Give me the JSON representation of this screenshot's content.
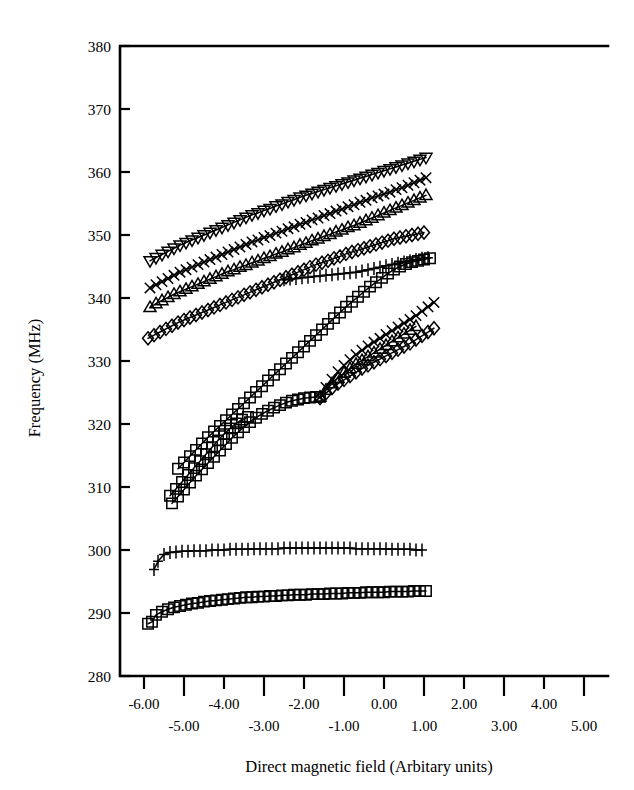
{
  "figure": {
    "width": 634,
    "height": 790,
    "background": "#ffffff",
    "ink_color": "#000000"
  },
  "chart_data": {
    "type": "line",
    "title": "",
    "subtitle": "",
    "xlabel": "Direct magnetic field (Arbitary units)",
    "ylabel": "Frequency (MHz)",
    "xlim": [
      -6.6,
      5.6
    ],
    "ylim": [
      280,
      380
    ],
    "grid": false,
    "legend": "none",
    "frame": "top-and-left-spines-with-bottom-axis",
    "xticks": [
      -6,
      -5,
      -4,
      -3,
      -2,
      -1,
      0,
      1,
      2,
      3,
      4,
      5
    ],
    "xticklabels": [
      "-6.00",
      "-5.00",
      "-4.00",
      "-3.00",
      "-2.00",
      "-1.00",
      "0.00",
      "1.00",
      "2.00",
      "3.00",
      "4.00",
      "5.00"
    ],
    "xticklabel_stagger": [
      "up",
      "down",
      "up",
      "down",
      "up",
      "down",
      "up",
      "down",
      "up",
      "down",
      "up",
      "down"
    ],
    "yticks": [
      280,
      290,
      300,
      310,
      320,
      330,
      340,
      350,
      360,
      370,
      380
    ],
    "yticklabels": [
      "280",
      "290",
      "300",
      "310",
      "320",
      "330",
      "340",
      "350",
      "360",
      "370",
      "380"
    ],
    "marker_size": 5.2,
    "series": [
      {
        "name": "branch-1-down-triangle",
        "marker": "triangle-down",
        "x": [
          -5.85,
          -5.7,
          -5.55,
          -5.4,
          -5.25,
          -5.1,
          -4.95,
          -4.8,
          -4.65,
          -4.5,
          -4.35,
          -4.2,
          -4.05,
          -3.9,
          -3.75,
          -3.6,
          -3.45,
          -3.3,
          -3.15,
          -3.0,
          -2.85,
          -2.7,
          -2.55,
          -2.4,
          -2.25,
          -2.1,
          -1.95,
          -1.8,
          -1.65,
          -1.5,
          -1.35,
          -1.2,
          -1.05,
          -0.9,
          -0.75,
          -0.6,
          -0.45,
          -0.3,
          -0.15,
          0.0,
          0.15,
          0.3,
          0.45,
          0.6,
          0.75,
          0.9,
          1.05
        ],
        "y": [
          345.9,
          346.4,
          346.9,
          347.4,
          347.9,
          348.4,
          348.8,
          349.2,
          349.6,
          350.0,
          350.4,
          350.8,
          351.2,
          351.6,
          352.0,
          352.4,
          352.8,
          353.2,
          353.5,
          353.9,
          354.2,
          354.6,
          354.9,
          355.3,
          355.6,
          356.0,
          356.3,
          356.6,
          356.9,
          357.2,
          357.5,
          357.8,
          358.1,
          358.4,
          358.7,
          359.0,
          359.3,
          359.6,
          359.9,
          360.2,
          360.5,
          360.8,
          361.1,
          361.4,
          361.7,
          362.0,
          362.3
        ]
      },
      {
        "name": "branch-2-x-cross",
        "marker": "x",
        "x": [
          -5.85,
          -5.7,
          -5.55,
          -5.4,
          -5.25,
          -5.1,
          -4.95,
          -4.8,
          -4.65,
          -4.5,
          -4.35,
          -4.2,
          -4.05,
          -3.9,
          -3.75,
          -3.6,
          -3.45,
          -3.3,
          -3.15,
          -3.0,
          -2.85,
          -2.7,
          -2.55,
          -2.4,
          -2.25,
          -2.1,
          -1.95,
          -1.8,
          -1.65,
          -1.5,
          -1.35,
          -1.2,
          -1.05,
          -0.9,
          -0.75,
          -0.6,
          -0.45,
          -0.3,
          -0.15,
          0.0,
          0.15,
          0.3,
          0.45,
          0.6,
          0.75,
          0.9,
          1.05
        ],
        "y": [
          341.6,
          342.1,
          342.6,
          343.1,
          343.6,
          344.1,
          344.5,
          344.9,
          345.3,
          345.7,
          346.1,
          346.5,
          346.9,
          347.3,
          347.7,
          348.1,
          348.5,
          348.9,
          349.2,
          349.6,
          349.9,
          350.3,
          350.6,
          351.0,
          351.3,
          351.7,
          352.0,
          352.4,
          352.7,
          353.1,
          353.4,
          353.8,
          354.1,
          354.5,
          354.8,
          355.2,
          355.5,
          355.9,
          356.2,
          356.5,
          356.8,
          357.2,
          357.5,
          357.9,
          358.3,
          358.7,
          359.1
        ]
      },
      {
        "name": "branch-3-up-triangle",
        "marker": "triangle-up",
        "x": [
          -5.85,
          -5.7,
          -5.55,
          -5.4,
          -5.25,
          -5.1,
          -4.95,
          -4.8,
          -4.65,
          -4.5,
          -4.35,
          -4.2,
          -4.05,
          -3.9,
          -3.75,
          -3.6,
          -3.45,
          -3.3,
          -3.15,
          -3.0,
          -2.85,
          -2.7,
          -2.55,
          -2.4,
          -2.25,
          -2.1,
          -1.95,
          -1.8,
          -1.65,
          -1.5,
          -1.35,
          -1.2,
          -1.05,
          -0.9,
          -0.75,
          -0.6,
          -0.45,
          -0.3,
          -0.15,
          0.0,
          0.15,
          0.3,
          0.45,
          0.6,
          0.75,
          0.9,
          1.05
        ],
        "y": [
          338.5,
          339.1,
          339.6,
          340.1,
          340.6,
          341.0,
          341.4,
          341.8,
          342.2,
          342.6,
          343.0,
          343.4,
          343.8,
          344.2,
          344.5,
          344.9,
          345.2,
          345.6,
          345.9,
          346.3,
          346.6,
          347.0,
          347.3,
          347.7,
          348.0,
          348.4,
          348.7,
          349.1,
          349.4,
          349.8,
          350.1,
          350.5,
          350.8,
          351.2,
          351.5,
          351.9,
          352.3,
          352.7,
          353.1,
          353.5,
          353.9,
          354.3,
          354.7,
          355.1,
          355.5,
          355.9,
          356.3
        ]
      },
      {
        "name": "branch-4-diamond",
        "marker": "diamond",
        "x": [
          -5.9,
          -5.75,
          -5.6,
          -5.45,
          -5.3,
          -5.15,
          -5.0,
          -4.85,
          -4.7,
          -4.55,
          -4.4,
          -4.25,
          -4.1,
          -3.95,
          -3.8,
          -3.65,
          -3.5,
          -3.35,
          -3.2,
          -3.05,
          -2.9,
          -2.75,
          -2.6,
          -2.45,
          -2.3,
          -2.15,
          -2.0,
          -1.85,
          -1.7,
          -1.55,
          -1.4,
          -1.25,
          -1.1,
          -0.95,
          -0.8,
          -0.65,
          -0.5,
          -0.35,
          -0.2,
          -0.05,
          0.1,
          0.25,
          0.4,
          0.55,
          0.7,
          0.85,
          1.0
        ],
        "y": [
          333.6,
          334.1,
          334.6,
          335.1,
          335.6,
          336.1,
          336.5,
          336.9,
          337.3,
          337.7,
          338.1,
          338.5,
          338.9,
          339.3,
          339.7,
          340.1,
          340.5,
          340.9,
          341.3,
          341.7,
          342.1,
          342.5,
          342.9,
          343.3,
          343.7,
          344.1,
          344.5,
          344.9,
          345.3,
          345.6,
          345.9,
          346.3,
          346.6,
          347.0,
          347.3,
          347.6,
          347.9,
          348.2,
          348.5,
          348.8,
          349.1,
          349.4,
          349.6,
          349.8,
          350.0,
          350.2,
          350.4
        ]
      },
      {
        "name": "plus-upper-344",
        "marker": "plus",
        "x": [
          -2.5,
          -2.35,
          -2.2,
          -2.05,
          -1.9,
          -1.75,
          -1.6,
          -1.45,
          -1.3,
          -1.15,
          -1.0,
          -0.85,
          -0.7,
          -0.55,
          -0.4,
          -0.25,
          -0.1,
          0.05,
          0.2,
          0.35,
          0.5,
          0.65,
          0.8,
          0.95,
          1.1
        ],
        "y": [
          342.9,
          343.0,
          343.1,
          343.2,
          343.3,
          343.4,
          343.5,
          343.6,
          343.7,
          343.8,
          343.9,
          344.0,
          344.1,
          344.3,
          344.5,
          344.7,
          344.9,
          345.1,
          345.3,
          345.5,
          345.7,
          345.9,
          346.1,
          346.3,
          346.4
        ]
      },
      {
        "name": "square-rising-upper",
        "marker": "square",
        "x": [
          -5.15,
          -5.0,
          -4.85,
          -4.7,
          -4.55,
          -4.4,
          -4.25,
          -4.1,
          -3.95,
          -3.8,
          -3.65,
          -3.5,
          -3.35,
          -3.2,
          -3.05,
          -2.9,
          -2.75,
          -2.6,
          -2.45,
          -2.3,
          -2.15,
          -2.0,
          -1.85,
          -1.7,
          -1.55,
          -1.4,
          -1.25,
          -1.1,
          -0.95,
          -0.8,
          -0.65,
          -0.5,
          -0.35,
          -0.2,
          -0.05,
          0.1,
          0.25,
          0.4,
          0.55,
          0.7,
          0.85,
          1.0,
          1.15
        ],
        "y": [
          312.9,
          313.9,
          314.9,
          315.9,
          316.9,
          317.9,
          318.8,
          319.7,
          320.6,
          321.5,
          322.4,
          323.3,
          324.2,
          325.1,
          326.0,
          326.9,
          327.8,
          328.7,
          329.6,
          330.5,
          331.4,
          332.3,
          333.2,
          334.1,
          335.0,
          335.9,
          336.8,
          337.7,
          338.6,
          339.4,
          340.2,
          341.0,
          341.8,
          342.5,
          343.2,
          343.9,
          344.5,
          345.0,
          345.4,
          345.7,
          345.9,
          346.1,
          346.3
        ]
      },
      {
        "name": "square-rising-middle",
        "marker": "square",
        "x": [
          -5.35,
          -5.2,
          -5.05,
          -4.9,
          -4.75,
          -4.6,
          -4.45,
          -4.3,
          -4.15,
          -4.0,
          -3.85,
          -3.7,
          -3.55,
          -3.4
        ],
        "y": [
          308.6,
          309.7,
          310.8,
          311.9,
          313.0,
          314.1,
          315.2,
          316.3,
          317.4,
          318.4,
          319.3,
          320.1,
          320.7,
          321.1
        ]
      },
      {
        "name": "square-rising-lower",
        "marker": "square",
        "x": [
          -5.3,
          -5.15,
          -5.0,
          -4.85,
          -4.7,
          -4.55,
          -4.4,
          -4.25,
          -4.1,
          -3.95,
          -3.8,
          -3.65,
          -3.5,
          -3.35,
          -3.2,
          -3.05,
          -2.9,
          -2.75,
          -2.6,
          -2.45,
          -2.3,
          -2.15,
          -2.0,
          -1.85,
          -1.7,
          -1.6
        ],
        "y": [
          307.4,
          308.5,
          309.6,
          310.7,
          311.8,
          312.8,
          313.8,
          314.8,
          315.8,
          316.8,
          317.8,
          318.7,
          319.5,
          320.3,
          321.0,
          321.6,
          322.1,
          322.6,
          323.0,
          323.4,
          323.7,
          323.9,
          324.1,
          324.2,
          324.3,
          324.3
        ]
      },
      {
        "name": "split-x-upper",
        "marker": "x",
        "x": [
          -1.6,
          -1.45,
          -1.3,
          -1.15,
          -1.0,
          -0.85,
          -0.7,
          -0.55,
          -0.4,
          -0.25,
          -0.1,
          0.05,
          0.2,
          0.35,
          0.5,
          0.65,
          0.8,
          0.95,
          1.1,
          1.25
        ],
        "y": [
          324.3,
          325.8,
          327.1,
          328.3,
          329.3,
          330.2,
          331.0,
          331.7,
          332.4,
          333.0,
          333.6,
          334.2,
          334.8,
          335.4,
          336.0,
          336.6,
          337.2,
          337.9,
          338.6,
          339.3
        ]
      },
      {
        "name": "split-triangle-middle",
        "marker": "triangle-up",
        "x": [
          -1.6,
          -1.45,
          -1.3,
          -1.15,
          -1.0,
          -0.85,
          -0.7,
          -0.55,
          -0.4,
          -0.25,
          -0.1,
          0.05,
          0.2,
          0.35,
          0.5,
          0.65,
          0.8
        ],
        "y": [
          324.3,
          325.4,
          326.4,
          327.3,
          328.1,
          328.8,
          329.5,
          330.1,
          330.7,
          331.3,
          331.9,
          332.5,
          333.1,
          333.7,
          334.3,
          334.9,
          335.5
        ]
      },
      {
        "name": "split-diamond-lower",
        "marker": "diamond",
        "x": [
          -1.6,
          -1.45,
          -1.3,
          -1.15,
          -1.0,
          -0.85,
          -0.7,
          -0.55,
          -0.4,
          -0.25,
          -0.1,
          0.05,
          0.2,
          0.35,
          0.5,
          0.65,
          0.8,
          0.95,
          1.1,
          1.25
        ],
        "y": [
          324.1,
          324.9,
          325.7,
          326.4,
          327.0,
          327.6,
          328.2,
          328.8,
          329.3,
          329.8,
          330.3,
          330.8,
          331.3,
          331.8,
          332.3,
          332.8,
          333.4,
          334.0,
          334.6,
          335.2
        ]
      },
      {
        "name": "plus-flat-300",
        "marker": "plus",
        "x": [
          -5.75,
          -5.65,
          -5.5,
          -5.35,
          -5.2,
          -5.05,
          -4.9,
          -4.75,
          -4.6,
          -4.45,
          -4.3,
          -4.15,
          -4.0,
          -3.85,
          -3.7,
          -3.55,
          -3.4,
          -3.25,
          -3.1,
          -2.95,
          -2.8,
          -2.65,
          -2.5,
          -2.35,
          -2.2,
          -2.05,
          -1.9,
          -1.75,
          -1.6,
          -1.45,
          -1.3,
          -1.15,
          -1.0,
          -0.85,
          -0.7,
          -0.55,
          -0.4,
          -0.25,
          -0.1,
          0.05,
          0.2,
          0.35,
          0.5,
          0.65,
          0.8,
          0.95
        ],
        "y": [
          296.9,
          298.2,
          299.3,
          299.6,
          299.7,
          299.8,
          299.8,
          299.9,
          299.9,
          299.9,
          300.0,
          300.0,
          300.0,
          300.1,
          300.1,
          300.1,
          300.1,
          300.2,
          300.2,
          300.2,
          300.2,
          300.2,
          300.3,
          300.3,
          300.3,
          300.3,
          300.3,
          300.3,
          300.3,
          300.3,
          300.3,
          300.3,
          300.3,
          300.3,
          300.2,
          300.2,
          300.2,
          300.2,
          300.2,
          300.2,
          300.1,
          300.1,
          300.1,
          300.1,
          300.0,
          300.0
        ]
      },
      {
        "name": "square-flat-292",
        "marker": "square",
        "x": [
          -5.9,
          -5.8,
          -5.7,
          -5.55,
          -5.4,
          -5.25,
          -5.1,
          -4.95,
          -4.8,
          -4.65,
          -4.5,
          -4.35,
          -4.2,
          -4.05,
          -3.9,
          -3.75,
          -3.6,
          -3.45,
          -3.3,
          -3.15,
          -3.0,
          -2.85,
          -2.7,
          -2.55,
          -2.4,
          -2.25,
          -2.1,
          -1.95,
          -1.8,
          -1.65,
          -1.5,
          -1.35,
          -1.2,
          -1.05,
          -0.9,
          -0.75,
          -0.6,
          -0.45,
          -0.3,
          -0.15,
          0.0,
          0.15,
          0.3,
          0.45,
          0.6,
          0.75,
          0.9,
          1.05
        ],
        "y": [
          288.3,
          288.6,
          289.7,
          290.2,
          290.6,
          290.9,
          291.1,
          291.3,
          291.5,
          291.6,
          291.8,
          291.9,
          292.0,
          292.1,
          292.2,
          292.3,
          292.4,
          292.5,
          292.5,
          292.6,
          292.6,
          292.7,
          292.7,
          292.8,
          292.8,
          292.9,
          292.9,
          292.9,
          293.0,
          293.0,
          293.0,
          293.1,
          293.1,
          293.1,
          293.2,
          293.2,
          293.2,
          293.3,
          293.3,
          293.3,
          293.3,
          293.4,
          293.4,
          293.4,
          293.4,
          293.5,
          293.5,
          293.5
        ]
      }
    ]
  }
}
